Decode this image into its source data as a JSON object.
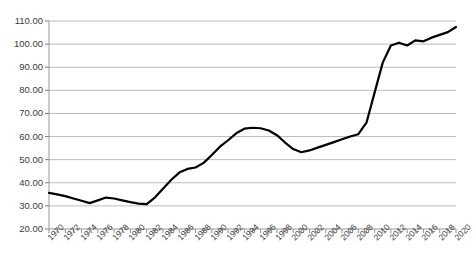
{
  "chart_data": {
    "type": "line",
    "title": "",
    "subtitle": "",
    "xlabel": "",
    "ylabel": "",
    "grid": true,
    "legend": "none",
    "xlim": [
      1970,
      2020
    ],
    "ylim": [
      20.0,
      110.0
    ],
    "y_ticks": [
      "110.00",
      "100.00",
      "90.00",
      "80.00",
      "70.00",
      "60.00",
      "50.00",
      "40.00",
      "30.00",
      "20.00"
    ],
    "y_tick_values": [
      110,
      100,
      90,
      80,
      70,
      60,
      50,
      40,
      30,
      20
    ],
    "x_tick_labels": [
      "1970",
      "1972",
      "1974",
      "1976",
      "1978",
      "1980",
      "1982",
      "1984",
      "1986",
      "1988",
      "1990",
      "1992",
      "1994",
      "1996",
      "1998",
      "2000",
      "2002",
      "2004",
      "2006",
      "2008",
      "2010",
      "2012",
      "2014",
      "2016",
      "2018",
      "2020"
    ],
    "x_minor_tick_step": 1,
    "series": [
      {
        "name": "series-1",
        "color": "#000000",
        "x": [
          1970,
          1971,
          1972,
          1973,
          1974,
          1975,
          1976,
          1977,
          1978,
          1979,
          1980,
          1981,
          1982,
          1983,
          1984,
          1985,
          1986,
          1987,
          1988,
          1989,
          1990,
          1991,
          1992,
          1993,
          1994,
          1995,
          1996,
          1997,
          1998,
          1999,
          2000,
          2001,
          2002,
          2003,
          2004,
          2005,
          2006,
          2007,
          2008,
          2009,
          2010,
          2011,
          2012,
          2013,
          2014,
          2015,
          2016,
          2017,
          2018,
          2019,
          2020
        ],
        "values": [
          35.6,
          35.0,
          34.2,
          33.2,
          32.2,
          31.2,
          32.4,
          33.6,
          33.2,
          32.4,
          31.6,
          31.0,
          30.8,
          33.6,
          37.4,
          41.2,
          44.4,
          46.0,
          46.6,
          48.6,
          52.0,
          55.6,
          58.4,
          61.4,
          63.4,
          63.8,
          63.6,
          62.6,
          60.6,
          57.4,
          54.6,
          53.2,
          54.0,
          55.2,
          56.4,
          57.6,
          58.8,
          60.0,
          61.0,
          66.0,
          79.0,
          92.0,
          99.4,
          100.6,
          99.4,
          101.6,
          101.2,
          102.8,
          104.0,
          105.2,
          107.4
        ]
      }
    ]
  },
  "axes": {
    "plot_left_px": 49,
    "plot_right_px": 456,
    "plot_top_px": 21,
    "plot_bottom_px": 229
  }
}
